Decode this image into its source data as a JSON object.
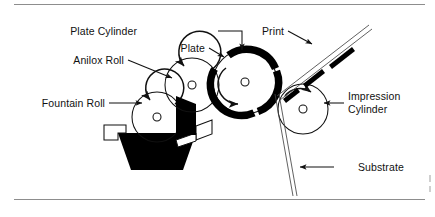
{
  "figure": {
    "type": "technical-diagram",
    "background_color": "#ffffff",
    "line_color": "#111111",
    "rule_color": "#8d8d8d",
    "ink_color": "#000000"
  },
  "labels": {
    "plate_cylinder": "Plate Cylinder",
    "plate": "Plate",
    "print": "Print",
    "anilox_roll": "Anilox Roll",
    "fountain_roll": "Fountain Roll",
    "impression_cylinder_line1": "Impression",
    "impression_cylinder_line2": "Cylinder",
    "substrate": "Substrate"
  },
  "components": [
    {
      "name": "fountain-roll",
      "shape": "circle",
      "cx": 157,
      "cy": 117,
      "r": 25,
      "hub_r": 4,
      "rotation": "counter-clockwise",
      "fill": "white"
    },
    {
      "name": "anilox-roll",
      "shape": "circle",
      "cx": 192,
      "cy": 85,
      "r": 27,
      "hub_r": 4,
      "rotation": "counter-clockwise",
      "fill": "white"
    },
    {
      "name": "plate-cylinder",
      "shape": "circle",
      "cx": 245,
      "cy": 82,
      "r": 32,
      "hub_r": 4,
      "rotation": "clockwise",
      "fill": "white",
      "plate_band": true
    },
    {
      "name": "impression-cylinder",
      "shape": "circle",
      "cx": 303,
      "cy": 109,
      "r": 25,
      "hub_r": 4,
      "rotation": "clockwise",
      "fill": "white"
    },
    {
      "name": "ink-fountain-pan",
      "shape": "trapezoid",
      "fill": "#000000"
    },
    {
      "name": "substrate-web",
      "shape": "double-line",
      "note": "enters from bottom, passes nip, exits upper right as Print"
    }
  ],
  "leaders": [
    {
      "name": "plate-cylinder-leader",
      "style": "horizontal-then-down-arrow",
      "target": "plate cylinder top"
    },
    {
      "name": "plate-leader",
      "style": "short-diagonal-arrow",
      "target": "black plate band"
    },
    {
      "name": "print-leader",
      "style": "diagonal-arrow",
      "target": "printed web"
    },
    {
      "name": "anilox-roll-leader",
      "style": "diagonal-arrow",
      "target": "anilox roll"
    },
    {
      "name": "fountain-roll-leader",
      "style": "horizontal-arrow",
      "target": "fountain roll"
    },
    {
      "name": "impression-leader",
      "style": "horizontal-arrow-left",
      "target": "impression cylinder"
    },
    {
      "name": "substrate-leader",
      "style": "horizontal-arrow-left",
      "target": "substrate web"
    }
  ],
  "rules": {
    "top_y": 4,
    "bottom_y": 199,
    "x_start": 14,
    "x_end": 425
  }
}
